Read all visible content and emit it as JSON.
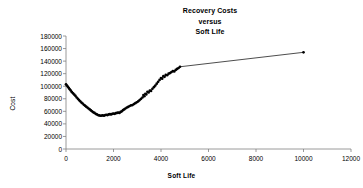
{
  "chart_data": {
    "type": "scatter",
    "title": "Recovery Costs versus Soft Life",
    "title_lines": [
      "Recovery Costs",
      "versus",
      "Soft Life"
    ],
    "xlabel": "Soft Life",
    "ylabel": "Cost",
    "xlim": [
      0,
      12000
    ],
    "ylim": [
      0,
      180000
    ],
    "xticks": [
      0,
      2000,
      4000,
      6000,
      8000,
      10000,
      12000
    ],
    "yticks": [
      0,
      20000,
      40000,
      60000,
      80000,
      100000,
      120000,
      140000,
      160000,
      180000
    ],
    "xtick_labels": [
      "0",
      "2000",
      "4000",
      "6000",
      "8000",
      "10000",
      "12000"
    ],
    "ytick_labels": [
      "0",
      "20000",
      "40000",
      "60000",
      "80000",
      "100000",
      "120000",
      "140000",
      "160000",
      "180000"
    ],
    "grid": false,
    "legend": null,
    "marker": "filled-circle",
    "line": "solid-thin-black",
    "series": [
      {
        "name": "Recovery Cost",
        "color": "#000000",
        "x": [
          0,
          40,
          80,
          120,
          160,
          200,
          250,
          300,
          350,
          400,
          450,
          500,
          550,
          600,
          650,
          700,
          750,
          800,
          850,
          900,
          950,
          1000,
          1050,
          1100,
          1150,
          1200,
          1250,
          1300,
          1350,
          1400,
          1450,
          1500,
          1550,
          1600,
          1650,
          1700,
          1750,
          1800,
          1850,
          1900,
          1950,
          2000,
          2050,
          2100,
          2150,
          2200,
          2250,
          2300,
          2350,
          2400,
          2450,
          2500,
          2560,
          2620,
          2680,
          2740,
          2800,
          2860,
          2920,
          2980,
          3040,
          3100,
          3160,
          3220,
          3260,
          3300,
          3340,
          3380,
          3430,
          3480,
          3530,
          3580,
          3640,
          3700,
          3760,
          3820,
          3880,
          3940,
          4000,
          4050,
          4100,
          4150,
          4200,
          4260,
          4320,
          4380,
          4440,
          4500,
          4560,
          4620,
          4680,
          4740,
          4800,
          10000
        ],
        "y": [
          103000,
          101000,
          99000,
          97000,
          95000,
          93000,
          90500,
          88500,
          86500,
          84500,
          82000,
          80000,
          78000,
          76000,
          74000,
          72500,
          70500,
          69000,
          67500,
          66000,
          64500,
          63000,
          61500,
          60000,
          58500,
          57500,
          56000,
          55000,
          54000,
          53500,
          53000,
          53200,
          53500,
          53000,
          54000,
          54500,
          54000,
          55000,
          55500,
          55000,
          56000,
          56500,
          56000,
          57000,
          57500,
          58000,
          57500,
          59000,
          60000,
          62000,
          63000,
          64500,
          66000,
          67000,
          68500,
          69500,
          70000,
          71500,
          73000,
          74500,
          76000,
          78000,
          80000,
          82000,
          86000,
          84000,
          88000,
          87000,
          91000,
          90000,
          93000,
          92500,
          96000,
          98500,
          101000,
          104000,
          107000,
          110000,
          113000,
          112000,
          116000,
          115000,
          118000,
          117500,
          120000,
          121000,
          122500,
          124000,
          123500,
          126000,
          127500,
          129000,
          131000,
          154000
        ]
      }
    ],
    "annotations": [
      "Dense noisy U-shaped cluster from x=0 to x=4800",
      "Single isolated far point at (10000, 154000) joined by a long straight segment"
    ]
  }
}
